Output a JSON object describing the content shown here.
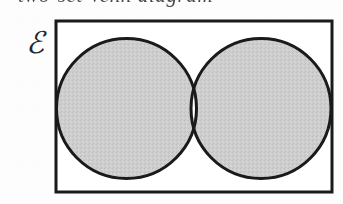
{
  "figure": {
    "kind": "venn-diagram",
    "title_fragment": "two-set Venn diagram",
    "caption_note": "cropped caption text at top edge of image",
    "universal_set_symbol": "ℰ",
    "universal_set_label": "E",
    "shaded_region_name": "symmetric difference",
    "shaded_region_notation": "A △ B"
  },
  "geometry": {
    "canvas": {
      "width": 343,
      "height": 204
    },
    "rectangle": {
      "x": 56,
      "y": 21,
      "width": 276,
      "height": 171,
      "stroke_width": 3
    },
    "left_circle": {
      "cx": 126.5,
      "cy": 108.5,
      "r": 70,
      "stroke_width": 3
    },
    "right_circle": {
      "cx": 261,
      "cy": 108.5,
      "r": 70,
      "stroke_width": 3
    },
    "intersection_top": {
      "x": 194,
      "y": 48
    },
    "intersection_bottom": {
      "x": 194,
      "y": 170
    }
  },
  "colors": {
    "page_background": "#fdfdfd",
    "ink": "#1a1a1a",
    "shaded_fill": "#cccccc",
    "unshaded_fill": "#ffffff",
    "symbol_ink": "#262626"
  },
  "regions": [
    {
      "name": "left-only",
      "label": "A \\ B",
      "shaded": true
    },
    {
      "name": "intersection",
      "label": "A ∩ B",
      "shaded": false
    },
    {
      "name": "right-only",
      "label": "B \\ A",
      "shaded": true
    },
    {
      "name": "outside",
      "label": "(A ∪ B)'",
      "shaded": false
    }
  ]
}
